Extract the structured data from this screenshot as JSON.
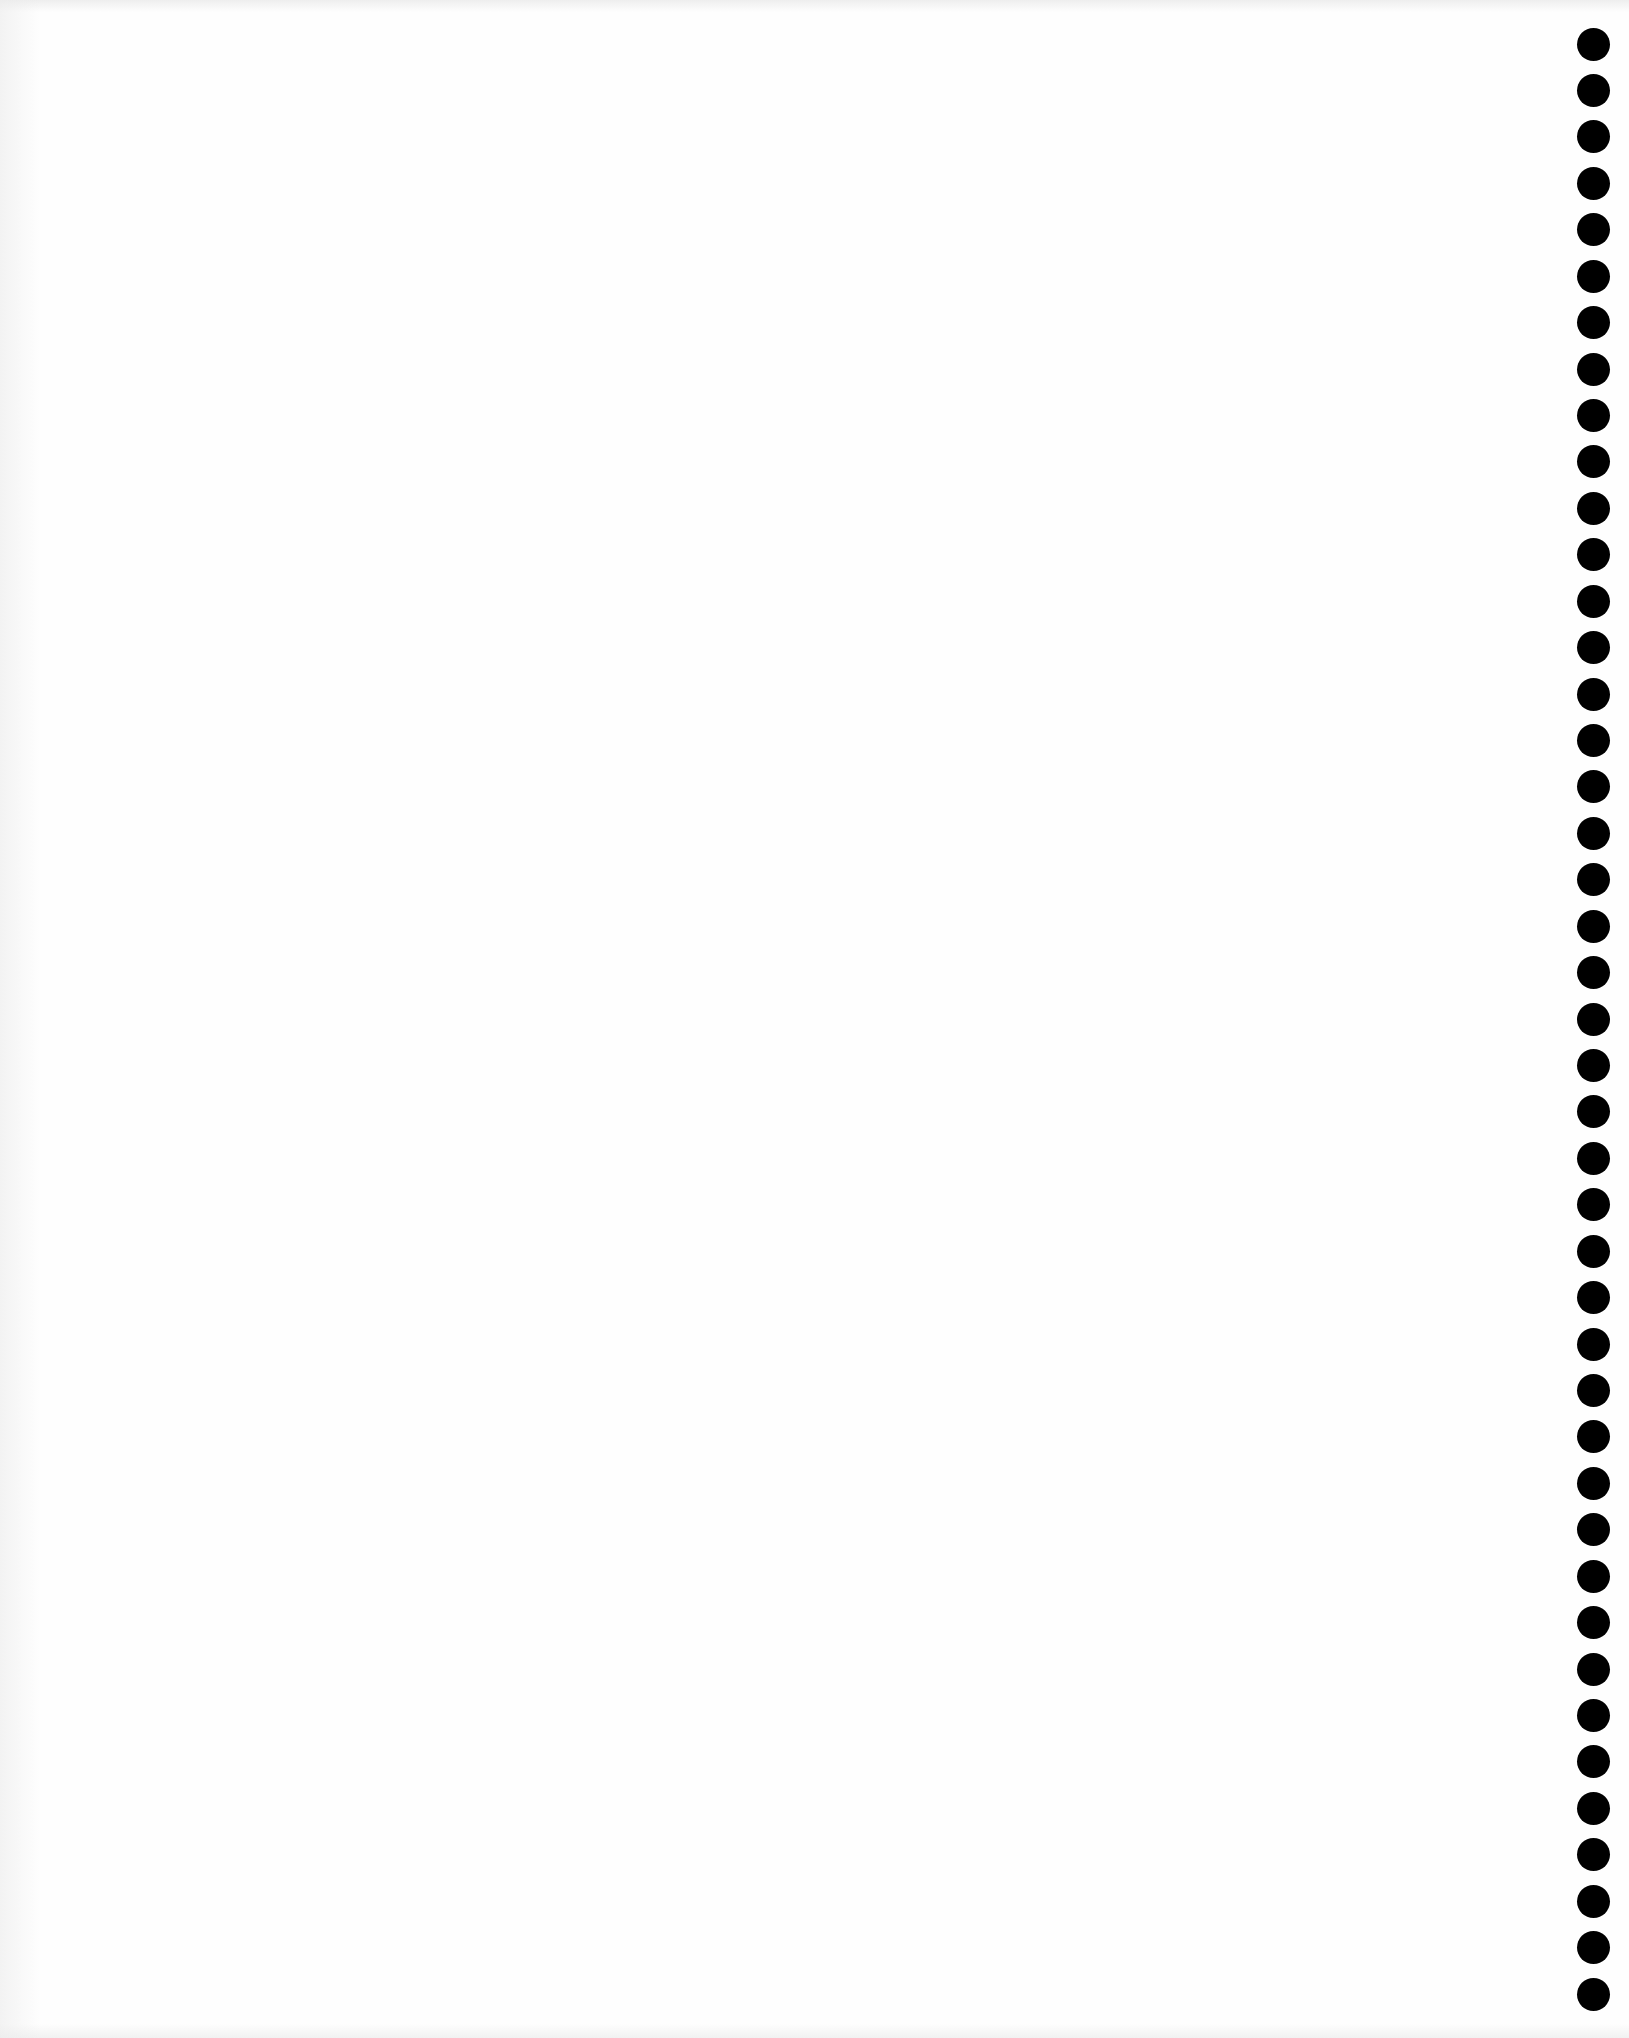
{
  "page": {
    "type": "blank scanned page",
    "background_color": "#fefefe",
    "text_content": ""
  },
  "binding_holes": {
    "count": 43,
    "color": "#000000",
    "diameter_px": 33,
    "center_x_px": 1593,
    "first_center_y_px": 44,
    "last_center_y_px": 1994,
    "spacing_px": 46.43
  }
}
